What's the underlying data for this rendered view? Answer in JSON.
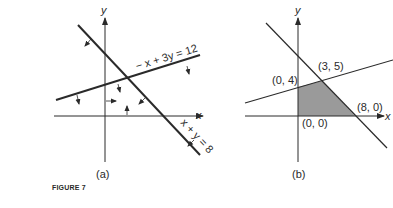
{
  "figure_caption": "FIGURE 7",
  "panel_a": {
    "label": "(a)",
    "axis_x_label": "x",
    "axis_y_label": "y",
    "line1_label": "x + y = 8",
    "line2_label": "− x + 3y = 12"
  },
  "panel_b": {
    "label": "(b)",
    "axis_x_label": "x",
    "axis_y_label": "y",
    "vertices": [
      {
        "label": "(0, 4)"
      },
      {
        "label": "(3, 5)"
      },
      {
        "label": "(8, 0)"
      },
      {
        "label": "(0, 0)"
      }
    ],
    "shade_color": "#9a9a9a"
  },
  "colors": {
    "ink": "#2a2a2a",
    "background": "#ffffff"
  }
}
